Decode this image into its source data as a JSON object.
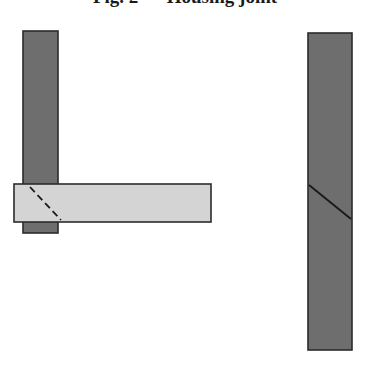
{
  "figure": {
    "title_fragment": "Fig. 2 — Housing joint",
    "background_color": "#ffffff",
    "width": 370,
    "height": 371
  },
  "palette": {
    "dark_member": "#6e6e6e",
    "light_member": "#d4d4d4",
    "outline": "#2b2b2b",
    "hidden_line": "#1a1a1a",
    "cut_line": "#1a1a1a",
    "background": "#ffffff"
  },
  "assemblies": [
    {
      "name": "assembled-joint",
      "label": "left assembly",
      "parts": [
        {
          "name": "vertical-post",
          "shade": "dark",
          "x": 23,
          "y": 31,
          "width": 35,
          "height": 202
        },
        {
          "name": "horizontal-rail",
          "shade": "light",
          "x": 14,
          "y": 184,
          "width": 197,
          "height": 38
        }
      ],
      "lines": [
        {
          "name": "hidden-mitre-line",
          "style": "dashed",
          "x1": 30,
          "y1": 187,
          "x2": 61,
          "y2": 220
        }
      ]
    },
    {
      "name": "separated-member",
      "label": "right member",
      "parts": [
        {
          "name": "vertical-bar",
          "shade": "dark",
          "x": 308,
          "y": 33,
          "width": 44,
          "height": 317
        }
      ],
      "lines": [
        {
          "name": "cut-face-line",
          "style": "solid",
          "x1": 309,
          "y1": 185,
          "x2": 351,
          "y2": 219
        }
      ]
    }
  ]
}
